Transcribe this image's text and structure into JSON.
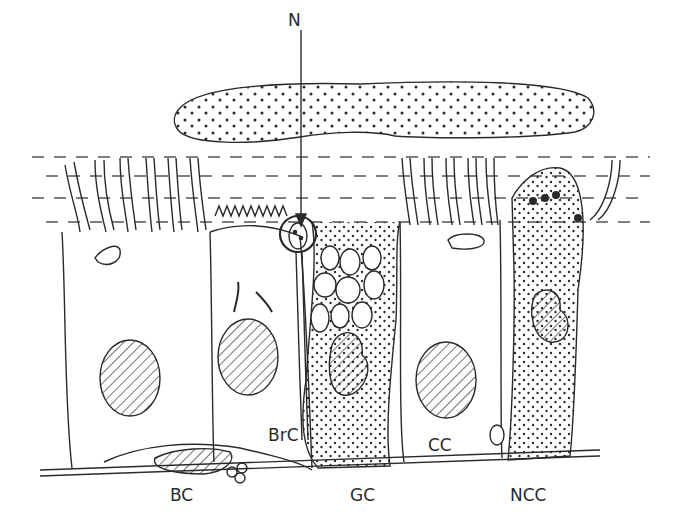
{
  "diagram": {
    "labels": {
      "n": "N",
      "brc": "BrC",
      "cc": "CC",
      "bc": "BC",
      "gc": "GC",
      "ncc": "NCC"
    },
    "colors": {
      "line": "#2a2a2a",
      "background": "#ffffff"
    }
  }
}
